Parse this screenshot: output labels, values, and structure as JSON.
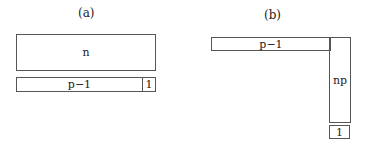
{
  "panel_a": {
    "label": "(a)",
    "top_block": "n",
    "bottom_left_block": "p−1",
    "bottom_right_block": "1"
  },
  "panel_b": {
    "label": "(b)",
    "horizontal_block": "p−1",
    "vertical_block": "np",
    "bottom_block": "1"
  }
}
